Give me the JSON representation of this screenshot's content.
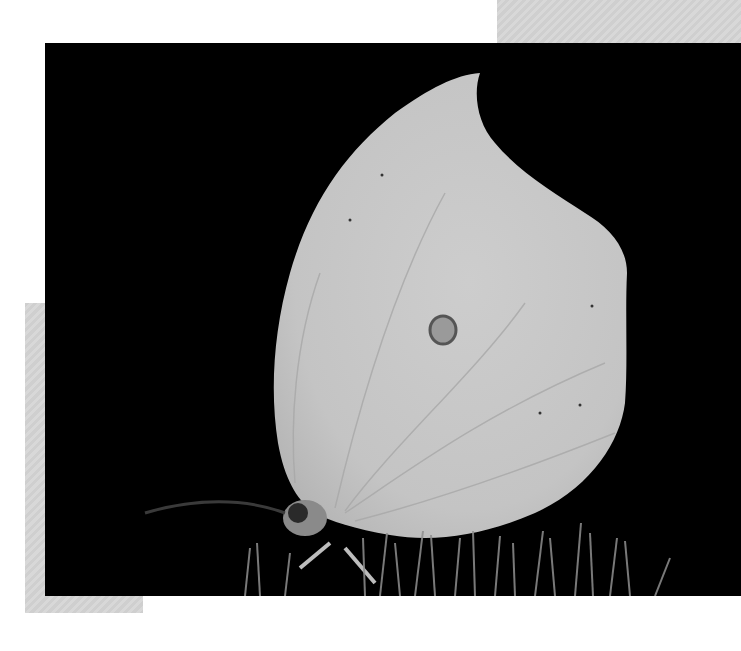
{
  "image": {
    "subject": "Brimstone butterfly with closed wings perched on grass, black background, grayscale photograph",
    "colors": {
      "background": "#000000",
      "page": "#ffffff",
      "wing": "#c8c8c8",
      "wing_shade": "#b4b4b4",
      "spot": "#6a6a6a",
      "decor_gray": "#d3d3d3"
    }
  }
}
